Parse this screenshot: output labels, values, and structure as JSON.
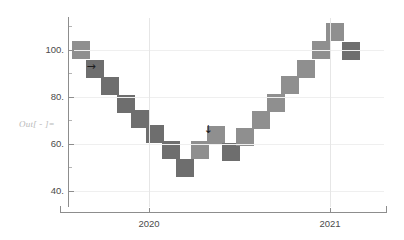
{
  "output_label": "Out[ - ]=",
  "chart_data": {
    "type": "scatter",
    "title": "",
    "subtitle": "",
    "xlabel": "",
    "ylabel": "",
    "marker": "square",
    "grid": true,
    "legend": null,
    "xlim": [
      2019.55,
      2021.3
    ],
    "ylim": [
      33,
      114
    ],
    "y_ticks": [
      "100.",
      "80.",
      "60.",
      "40."
    ],
    "y_tick_values": [
      100,
      80,
      60,
      40
    ],
    "x_ticks": [
      "2020",
      "2021"
    ],
    "x_tick_values": [
      2020,
      2021
    ],
    "colors": {
      "marker_dark": "#6e6e6e",
      "marker_light": "#8f8f8f",
      "axis": "#8d8d8d",
      "grid": "#efefef",
      "grid_major": "#e6e6e6",
      "label_text": "#4b4b4b",
      "out_label_text": "#b9b9b9",
      "background": "#ffffff"
    },
    "points": [
      {
        "x": 2019.62,
        "y": 100.0,
        "shade": "light"
      },
      {
        "x": 2019.7,
        "y": 92.0,
        "shade": "dark"
      },
      {
        "x": 2019.78,
        "y": 84.5,
        "shade": "dark"
      },
      {
        "x": 2019.87,
        "y": 77.0,
        "shade": "dark"
      },
      {
        "x": 2019.95,
        "y": 70.5,
        "shade": "dark"
      },
      {
        "x": 2020.03,
        "y": 64.0,
        "shade": "dark"
      },
      {
        "x": 2020.12,
        "y": 57.5,
        "shade": "dark"
      },
      {
        "x": 2020.2,
        "y": 49.5,
        "shade": "dark"
      },
      {
        "x": 2020.28,
        "y": 57.5,
        "shade": "light"
      },
      {
        "x": 2020.37,
        "y": 63.5,
        "shade": "light"
      },
      {
        "x": 2020.45,
        "y": 56.5,
        "shade": "dark"
      },
      {
        "x": 2020.53,
        "y": 63.0,
        "shade": "light"
      },
      {
        "x": 2020.62,
        "y": 70.0,
        "shade": "light"
      },
      {
        "x": 2020.7,
        "y": 77.5,
        "shade": "light"
      },
      {
        "x": 2020.78,
        "y": 85.0,
        "shade": "light"
      },
      {
        "x": 2020.87,
        "y": 92.0,
        "shade": "light"
      },
      {
        "x": 2020.95,
        "y": 100.0,
        "shade": "light"
      },
      {
        "x": 2021.03,
        "y": 107.5,
        "shade": "light"
      },
      {
        "x": 2021.12,
        "y": 99.5,
        "shade": "dark"
      }
    ],
    "annotations": [
      {
        "name": "right-arrow-annotation",
        "glyph": "→",
        "x": 2019.68,
        "y": 92.5
      },
      {
        "name": "down-arrow-annotation",
        "glyph": "↓",
        "x": 2020.33,
        "y": 66.0
      }
    ]
  }
}
